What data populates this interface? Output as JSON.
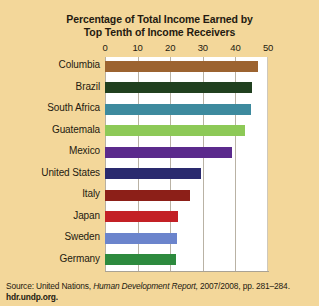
{
  "chart_data": {
    "type": "bar",
    "orientation": "horizontal",
    "title": "Percentage of Total Income Earned by Top Tenth of Income Receivers",
    "title_line1": "Percentage of Total Income Earned by",
    "title_line2": "Top Tenth of Income Receivers",
    "xlabel": "",
    "ylabel": "",
    "xlim": [
      0,
      50
    ],
    "xticks": [
      0,
      10,
      20,
      30,
      40,
      50
    ],
    "xtick_labels": [
      "0",
      "10",
      "20",
      "30",
      "40",
      "50"
    ],
    "grid": true,
    "legend": "none",
    "categories": [
      "Columbia",
      "Brazil",
      "South Africa",
      "Guatemala",
      "Mexico",
      "United States",
      "Italy",
      "Japan",
      "Sweden",
      "Germany"
    ],
    "values": [
      47,
      45,
      44.7,
      43,
      39,
      29.5,
      26,
      22.5,
      22.2,
      21.7
    ],
    "bar_colors": [
      "#9c6330",
      "#20401f",
      "#3d8a9e",
      "#8dc957",
      "#5b2a8c",
      "#2a2a6e",
      "#8c1f18",
      "#c32025",
      "#6b84cc",
      "#2d8a3e"
    ],
    "bars": [
      {
        "label": "Columbia",
        "value": 47,
        "color": "#9c6330"
      },
      {
        "label": "Brazil",
        "value": 45,
        "color": "#20401f"
      },
      {
        "label": "South Africa",
        "value": 44.7,
        "color": "#3d8a9e"
      },
      {
        "label": "Guatemala",
        "value": 43,
        "color": "#8dc957"
      },
      {
        "label": "Mexico",
        "value": 39,
        "color": "#5b2a8c"
      },
      {
        "label": "United States",
        "value": 29.5,
        "color": "#2a2a6e"
      },
      {
        "label": "Italy",
        "value": 26,
        "color": "#8c1f18"
      },
      {
        "label": "Japan",
        "value": 22.5,
        "color": "#c32025"
      },
      {
        "label": "Sweden",
        "value": 22.2,
        "color": "#6b84cc"
      },
      {
        "label": "Germany",
        "value": 21.7,
        "color": "#2d8a3e"
      }
    ]
  },
  "source": {
    "prefix": "Source: United Nations,",
    "publication": "Human Development Report,",
    "edition": "2007/2008,",
    "pages": "pp. 281–284.",
    "url": "hdr.undp.org."
  },
  "colors": {
    "background": "#f3d79a",
    "plot_background": "#ffffff",
    "gridline": "#b9b2a4",
    "text": "#241a10"
  }
}
